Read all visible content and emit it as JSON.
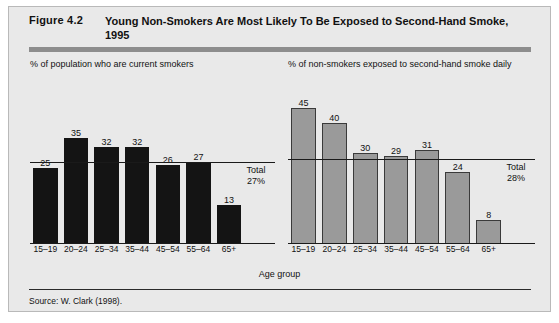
{
  "figure": {
    "number": "Figure 4.2",
    "title": "Young Non-Smokers Are Most Likely To Be Exposed to Second-Hand Smoke, 1995",
    "axis_title": "Age group",
    "source": "Source:  W. Clark (1998)."
  },
  "chart_data": [
    {
      "type": "bar",
      "title": "% of population who are current smokers",
      "xlabel": "Age group",
      "ylabel": "",
      "ylim": [
        0,
        48
      ],
      "grid": false,
      "categories": [
        "15–19",
        "20–24",
        "25–34",
        "35–44",
        "45–54",
        "55–64",
        "65+"
      ],
      "values": [
        25,
        35,
        32,
        32,
        26,
        27,
        13
      ],
      "reference_line": {
        "value": 27,
        "label_line1": "Total",
        "label_line2": "27%"
      },
      "bar_color": "#141414"
    },
    {
      "type": "bar",
      "title": "% of non-smokers exposed to second-hand smoke daily",
      "xlabel": "Age group",
      "ylabel": "",
      "ylim": [
        0,
        48
      ],
      "grid": false,
      "categories": [
        "15–19",
        "20–24",
        "25–34",
        "35–44",
        "45–54",
        "55–64",
        "65+"
      ],
      "values": [
        45,
        40,
        30,
        29,
        31,
        24,
        8
      ],
      "reference_line": {
        "value": 28,
        "label_line1": "Total",
        "label_line2": "28%"
      },
      "bar_color": "#9a9a9a"
    }
  ]
}
